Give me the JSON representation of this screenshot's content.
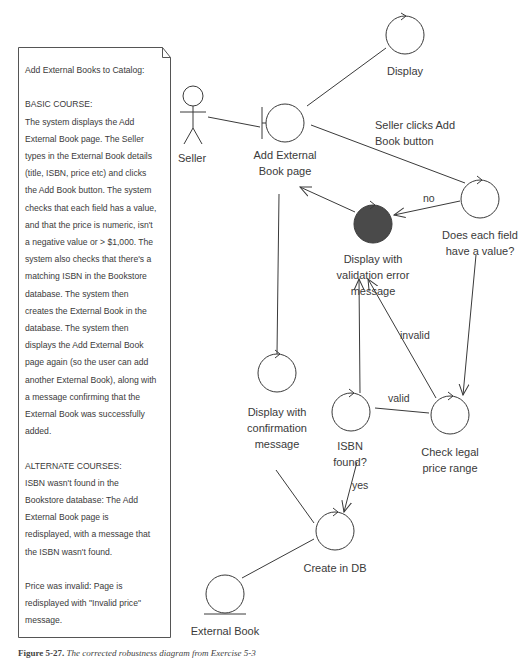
{
  "note": {
    "title": "Add External Books to Catalog:",
    "basic_course_heading": "BASIC COURSE:",
    "basic_course_lines": [
      "The system displays the Add",
      "External Book page. The Seller",
      "types in the External Book details",
      "(title, ISBN, price etc) and clicks",
      "the Add Book button. The system",
      "checks that each field has a value,",
      "and that the price is numeric, isn't",
      "a negative value or > $1,000. The",
      "system also checks that there's a",
      "matching ISBN in the Bookstore",
      "database. The system then",
      "creates the External Book in the",
      "database. The system then",
      "displays the Add External Book",
      "page again (so the user can add",
      "another External Book), along with",
      "a message confirming that the",
      "External Book was successfully",
      "added."
    ],
    "alternate_courses_heading": "ALTERNATE COURSES:",
    "alternate_1_lines": [
      "ISBN wasn't found in the",
      "Bookstore database: The Add",
      "External Book page is",
      "redisplayed, with a message that",
      "the ISBN wasn't found."
    ],
    "alternate_2_lines": [
      "Price was invalid: Page is",
      "redisplayed with \"Invalid price\"",
      "message."
    ]
  },
  "diagram": {
    "actor": {
      "label": "Seller",
      "type": "actor"
    },
    "boundary": {
      "label_line1": "Add External",
      "label_line2": "Book page",
      "type": "boundary"
    },
    "controllers": {
      "display": {
        "label": "Display"
      },
      "does_each_field": {
        "label_line1": "Does each field",
        "label_line2": "have a value?"
      },
      "display_validation_error": {
        "label_line1": "Display with",
        "label_line2": "validation error",
        "label_line3": "message",
        "highlighted": true
      },
      "display_confirmation": {
        "label_line1": "Display with",
        "label_line2": "confirmation",
        "label_line3": "message"
      },
      "isbn_found": {
        "label_line1": "ISBN",
        "label_line2": "found?"
      },
      "check_price": {
        "label_line1": "Check legal",
        "label_line2": "price range"
      },
      "create_in_db": {
        "label": "Create in DB"
      }
    },
    "entity": {
      "label": "External Book",
      "type": "entity"
    },
    "edge_labels": {
      "seller_clicks_line1": "Seller clicks Add",
      "seller_clicks_line2": "Book button",
      "no": "no",
      "invalid": "invalid",
      "valid": "valid",
      "yes": "yes"
    },
    "colors": {
      "stroke": "#3a3a3a",
      "highlight_fill": "#4a4a4a",
      "background": "#ffffff"
    }
  },
  "caption": {
    "figure": "Figure 5-27.",
    "text": "The corrected robustness diagram from Exercise 5-3"
  }
}
